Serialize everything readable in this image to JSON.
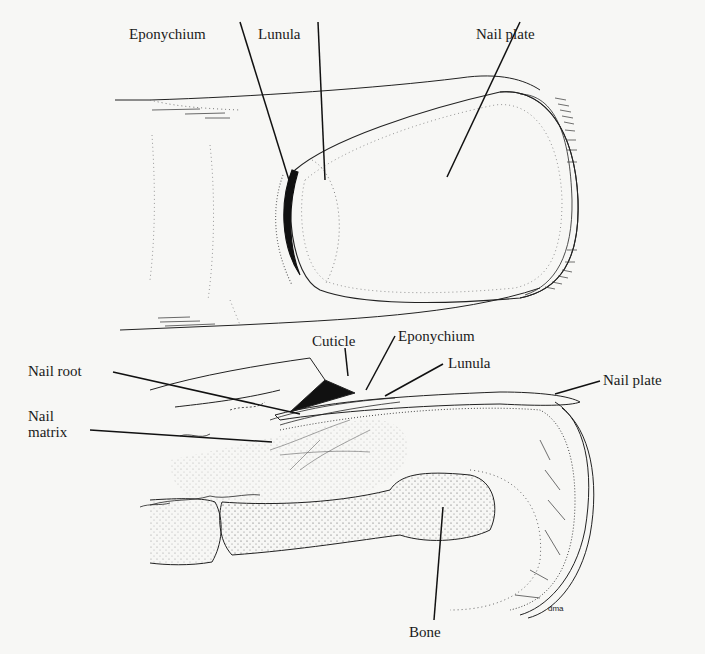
{
  "figure": {
    "background": "#f7f7f5",
    "ink": "#1a1a1a",
    "top_view": {
      "labels": [
        {
          "id": "eponychium",
          "text": "Eponychium"
        },
        {
          "id": "lunula",
          "text": "Lunula"
        },
        {
          "id": "nail-plate",
          "text": "Nail plate"
        }
      ]
    },
    "cross_section": {
      "labels": [
        {
          "id": "cuticle",
          "text": "Cuticle"
        },
        {
          "id": "eponychium",
          "text": "Eponychium"
        },
        {
          "id": "lunula",
          "text": "Lunula"
        },
        {
          "id": "nail-root",
          "text": "Nail root"
        },
        {
          "id": "nail-plate",
          "text": "Nail plate"
        },
        {
          "id": "nail-matrix-line1",
          "text": "Nail"
        },
        {
          "id": "nail-matrix-line2",
          "text": "matrix"
        },
        {
          "id": "bone",
          "text": "Bone"
        }
      ]
    },
    "signature": "dma"
  }
}
